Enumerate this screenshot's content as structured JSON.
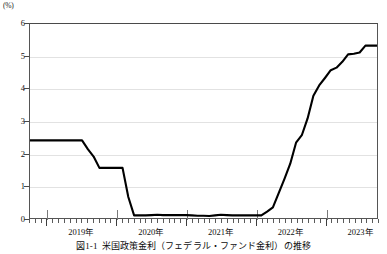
{
  "unit_label": "(%)",
  "caption": {
    "number": "図1-1",
    "text": "米国政策金利（フェデラル・ファンド金利）の推移"
  },
  "colors": {
    "line": "#000000",
    "grid": "#e2e2e2",
    "frame": "#555555",
    "text": "#111111",
    "background": "#ffffff"
  },
  "chart_data": {
    "type": "line",
    "title": "米国政策金利（フェデラル・ファンド金利）の推移",
    "xlabel": "",
    "ylabel": "(%)",
    "ylim": [
      0,
      6
    ],
    "yticks": [
      0,
      1,
      2,
      3,
      4,
      5,
      6
    ],
    "ytick_labels": [
      "0",
      "1",
      "2",
      "3",
      "4",
      "5",
      "6"
    ],
    "xlim": [
      "2018-10",
      "2023-10"
    ],
    "xtick_labels": [
      "2019年",
      "2020年",
      "2021年",
      "2022年",
      "2023年"
    ],
    "xtick_positions": [
      "2019-07",
      "2020-07",
      "2021-07",
      "2022-07",
      "2023-07"
    ],
    "x_major_ticks": [
      "2019-01",
      "2020-01",
      "2021-01",
      "2022-01",
      "2023-01"
    ],
    "x_minor_tick_interval": "1 month",
    "grid": "horizontal",
    "legend": "none",
    "series": [
      {
        "name": "米国政策金利（フェデラル・ファンド金利）",
        "color": "#000000",
        "x": [
          "2018-10",
          "2018-11",
          "2018-12",
          "2019-01",
          "2019-02",
          "2019-03",
          "2019-04",
          "2019-05",
          "2019-06",
          "2019-07",
          "2019-08",
          "2019-09",
          "2019-10",
          "2019-11",
          "2019-12",
          "2020-01",
          "2020-02",
          "2020-03",
          "2020-04",
          "2020-05",
          "2020-06",
          "2020-07",
          "2020-08",
          "2020-09",
          "2020-10",
          "2020-11",
          "2020-12",
          "2021-01",
          "2021-02",
          "2021-03",
          "2021-04",
          "2021-05",
          "2021-06",
          "2021-07",
          "2021-08",
          "2021-09",
          "2021-10",
          "2021-11",
          "2021-12",
          "2022-01",
          "2022-02",
          "2022-03",
          "2022-04",
          "2022-05",
          "2022-06",
          "2022-07",
          "2022-08",
          "2022-09",
          "2022-10",
          "2022-11",
          "2022-12",
          "2023-01",
          "2023-02",
          "2023-03",
          "2023-04",
          "2023-05",
          "2023-06",
          "2023-07",
          "2023-08",
          "2023-09",
          "2023-10"
        ],
        "y": [
          2.4,
          2.4,
          2.4,
          2.4,
          2.4,
          2.4,
          2.4,
          2.4,
          2.4,
          2.4,
          2.13,
          1.9,
          1.55,
          1.55,
          1.55,
          1.55,
          1.55,
          0.65,
          0.08,
          0.08,
          0.08,
          0.09,
          0.1,
          0.09,
          0.09,
          0.09,
          0.09,
          0.09,
          0.08,
          0.07,
          0.07,
          0.06,
          0.08,
          0.1,
          0.09,
          0.08,
          0.08,
          0.08,
          0.08,
          0.08,
          0.08,
          0.2,
          0.33,
          0.77,
          1.21,
          1.68,
          2.33,
          2.56,
          3.08,
          3.78,
          4.1,
          4.33,
          4.57,
          4.65,
          4.83,
          5.06,
          5.08,
          5.12,
          5.33,
          5.33,
          5.33
        ]
      }
    ],
    "annotations": [
      {
        "label": "開始水準",
        "value": 2.4
      },
      {
        "label": "ゼロ金利下限",
        "value": 0.08
      },
      {
        "label": "直近水準",
        "value": 5.33
      }
    ]
  }
}
